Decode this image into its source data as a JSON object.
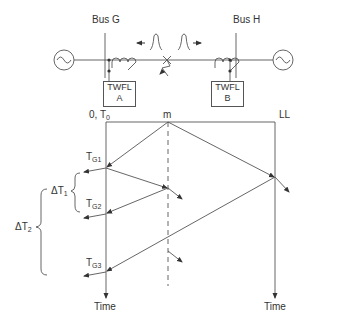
{
  "diagram": {
    "type": "traveling-wave lattice diagram",
    "buses": [
      {
        "id": "G",
        "label": "Bus G"
      },
      {
        "id": "H",
        "label": "Bus H"
      }
    ],
    "fault_locators": [
      {
        "line1": "TWFL",
        "line2": "A"
      },
      {
        "line1": "TWFL",
        "line2": "B"
      }
    ],
    "lattice": {
      "origin_label": "0, T",
      "origin_sub": "0",
      "fault_label": "m",
      "remote_end_label": "LL",
      "left_axis_label": "Time",
      "right_axis_label": "Time",
      "arrivals": [
        {
          "main": "T",
          "sub": "G1"
        },
        {
          "main": "T",
          "sub": "G2"
        },
        {
          "main": "T",
          "sub": "G3"
        }
      ],
      "intervals": [
        {
          "main": "ΔT",
          "sub": "1"
        },
        {
          "main": "ΔT",
          "sub": "2"
        }
      ]
    },
    "colors": {
      "line": "#555555",
      "text": "#333333",
      "background": "#ffffff"
    }
  }
}
